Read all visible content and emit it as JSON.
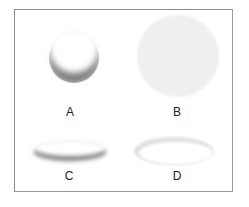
{
  "figure": {
    "panels": [
      {
        "id": "A",
        "label": "A",
        "description": "sphere with shadow on lower edge"
      },
      {
        "id": "B",
        "label": "B",
        "description": "flat light gray disc"
      },
      {
        "id": "C",
        "label": "C",
        "description": "flattened ellipse with shadow along bottom edge"
      },
      {
        "id": "D",
        "label": "D",
        "description": "ellipse ring with light rim"
      }
    ],
    "colors": {
      "border": "#8a8a8a",
      "shadow": "#6e6e6e",
      "disc": "#efefef",
      "text": "#222222"
    }
  }
}
